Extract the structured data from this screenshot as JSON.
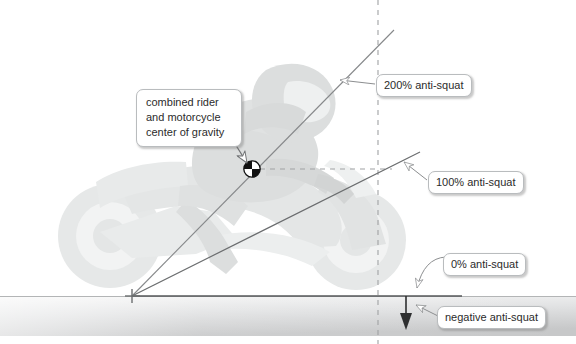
{
  "figure": {
    "background_color": "#ffffff"
  },
  "callouts": {
    "center_of_gravity": "combined rider and motorcycle center of gravity",
    "anti_squat_200": "200% anti-squat",
    "anti_squat_100": "100% anti-squat",
    "anti_squat_0": "0% anti-squat",
    "anti_squat_negative": "negative anti-squat"
  },
  "markers": {
    "cg_symbol": "center-of-gravity-symbol",
    "contact_patch": "rear-contact-patch-cross",
    "force_arrow": "downward-force-arrow"
  },
  "geometry": {
    "contact_point": {
      "x": 132,
      "y": 296
    },
    "cg_point": {
      "x": 252,
      "y": 169
    },
    "vertical_reference_x": 378,
    "ground_line_y": 296,
    "line_200_end": {
      "x": 394,
      "y": 30
    },
    "line_100_end": {
      "x": 420,
      "y": 152
    },
    "ground_band": {
      "top": 296,
      "bottom": 336
    }
  },
  "colors": {
    "ground_light": "#f2f2f2",
    "ground_dark": "#c9cacb",
    "line": "#6e7072",
    "dashed": "#9a9c9e",
    "callout_border": "#b9bcbe",
    "text": "#2b2b2b",
    "silhouette": "#e2e4e4"
  },
  "silhouette": {
    "name": "motorcycle-and-rider-silhouette",
    "description": "faint light gray sport motorcycle with tucked rider"
  }
}
